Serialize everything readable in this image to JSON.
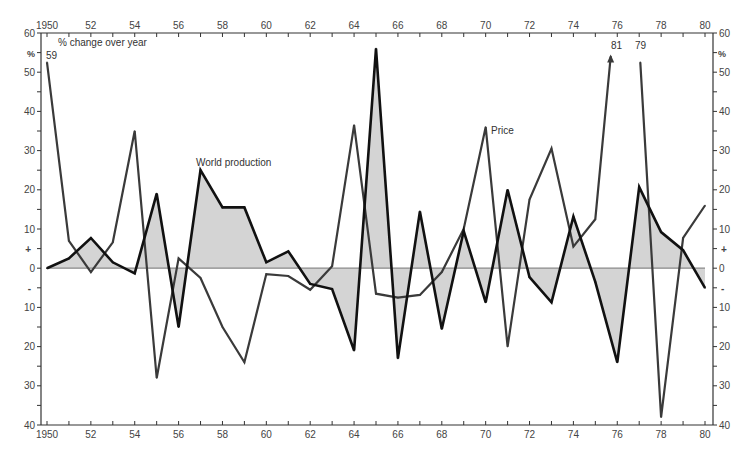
{
  "chart_data": {
    "type": "line",
    "title": "",
    "ylabel": "% change over year",
    "y_unit_label": "%",
    "xlabel": "",
    "xlim": [
      1950,
      1980
    ],
    "ylim": [
      -40,
      60
    ],
    "x_tick_labels": [
      "1950",
      "52",
      "54",
      "56",
      "58",
      "60",
      "62",
      "64",
      "66",
      "68",
      "70",
      "72",
      "74",
      "76",
      "78",
      "80"
    ],
    "x_tick_values": [
      1950,
      1952,
      1954,
      1956,
      1958,
      1960,
      1962,
      1964,
      1966,
      1968,
      1970,
      1972,
      1974,
      1976,
      1978,
      1980
    ],
    "y_tick_values": [
      60,
      50,
      40,
      30,
      20,
      10,
      0,
      -10,
      -20,
      -30,
      -40
    ],
    "y_tick_labels": [
      "60",
      "50",
      "40",
      "30",
      "20",
      "10",
      "0",
      "10",
      "20",
      "30",
      "40"
    ],
    "sign_markers": {
      "plus": "+",
      "minus": "-"
    },
    "grid": false,
    "zero_line": true,
    "x": [
      1950,
      1951,
      1952,
      1953,
      1954,
      1955,
      1956,
      1957,
      1958,
      1959,
      1960,
      1961,
      1962,
      1963,
      1964,
      1965,
      1966,
      1967,
      1968,
      1969,
      1970,
      1971,
      1972,
      1973,
      1974,
      1975,
      1976,
      1977,
      1978,
      1979,
      1980
    ],
    "series": [
      {
        "name": "World production",
        "label": "World production",
        "style": "bold-black-filled",
        "color": "#111111",
        "fill": "#d4d4d4",
        "values": [
          0,
          2.5,
          7.7,
          1.5,
          -1.3,
          19,
          -15,
          25,
          15.5,
          15.5,
          1.5,
          4.3,
          -4,
          -5.3,
          -21,
          56,
          -23,
          14.5,
          -15.5,
          9.5,
          -8.7,
          20,
          -2.3,
          -8.7,
          13.2,
          -3.5,
          -24,
          20.7,
          9.2,
          4.6,
          -5
        ]
      },
      {
        "name": "Price",
        "label": "Price",
        "style": "gray",
        "color": "#3a3a3a",
        "values": [
          59,
          7,
          -1,
          6.6,
          35,
          -28,
          2.5,
          -2.5,
          -15,
          -24,
          -1.5,
          -2,
          -5.5,
          0.5,
          36.5,
          -6.5,
          -7.5,
          -6.8,
          -1,
          10,
          36,
          -20,
          17.5,
          30.5,
          5.5,
          12.5,
          81,
          79,
          -38,
          7.7,
          16
        ]
      }
    ],
    "annotations": [
      {
        "text": "59",
        "x": 1950,
        "series": "Price",
        "note": "off-scale value"
      },
      {
        "text": "81",
        "x": 1976,
        "series": "Price",
        "note": "off-scale value, arrow up"
      },
      {
        "text": "79",
        "x": 1977,
        "series": "Price",
        "note": "off-scale value"
      }
    ],
    "legend": "inline labels"
  }
}
